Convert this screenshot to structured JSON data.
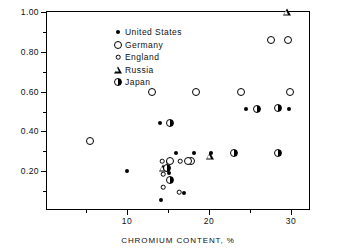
{
  "chart_data": {
    "type": "scatter",
    "title": "",
    "xlabel": "CHROMIUM  CONTENT, %",
    "ylabel": "CARBON  CONTENT, %",
    "xlim": [
      0.25,
      32.45
    ],
    "ylim": [
      0.0,
      1.0
    ],
    "grid": false,
    "legend_position": "top-left",
    "xticks_major": [
      10,
      20,
      30
    ],
    "xticks_major_labels": [
      "10",
      "20",
      "30"
    ],
    "xticks_minor": [
      5,
      15,
      25
    ],
    "yticks_major": [
      0.2,
      0.4,
      0.6,
      0.8,
      1.0
    ],
    "yticks_major_labels": [
      "0.20",
      "0.40",
      "0.60",
      "0.80",
      "1.00"
    ],
    "yticks_minor": [
      0.1,
      0.3,
      0.5,
      0.7,
      0.9
    ],
    "series": [
      {
        "name": "United States",
        "marker": "filled-dot",
        "points": [
          [
            10.0,
            0.2
          ],
          [
            14.0,
            0.44
          ],
          [
            15.0,
            0.245
          ],
          [
            15.1,
            0.19
          ],
          [
            15.1,
            0.155
          ],
          [
            16.0,
            0.29
          ],
          [
            18.2,
            0.29
          ],
          [
            20.3,
            0.29
          ],
          [
            24.5,
            0.515
          ],
          [
            29.8,
            0.515
          ],
          [
            14.1,
            0.055
          ],
          [
            16.9,
            0.09
          ]
        ]
      },
      {
        "name": "Germany",
        "marker": "open-circle-large",
        "points": [
          [
            5.5,
            0.35
          ],
          [
            13.0,
            0.6
          ],
          [
            18.4,
            0.6
          ],
          [
            23.9,
            0.6
          ],
          [
            29.9,
            0.6
          ],
          [
            27.6,
            0.86
          ],
          [
            29.6,
            0.86
          ],
          [
            15.3,
            0.25
          ],
          [
            17.8,
            0.25
          ],
          [
            17.5,
            0.25
          ]
        ]
      },
      {
        "name": "England",
        "marker": "open-circle-small",
        "points": [
          [
            14.3,
            0.25
          ],
          [
            16.5,
            0.25
          ],
          [
            14.4,
            0.185
          ],
          [
            14.4,
            0.12
          ],
          [
            16.4,
            0.095
          ]
        ]
      },
      {
        "name": "Russia",
        "marker": "open-triangle",
        "points": [
          [
            29.5,
            1.0
          ],
          [
            14.4,
            0.215
          ],
          [
            20.1,
            0.275
          ]
        ]
      },
      {
        "name": "Japan",
        "marker": "half-filled-circle",
        "points": [
          [
            15.2,
            0.44
          ],
          [
            14.9,
            0.215
          ],
          [
            15.2,
            0.155
          ],
          [
            23.0,
            0.29
          ],
          [
            28.4,
            0.29
          ],
          [
            28.4,
            0.52
          ],
          [
            25.9,
            0.515
          ]
        ]
      }
    ]
  },
  "legend": {
    "entries": [
      {
        "label": "United States",
        "marker": "filled-dot"
      },
      {
        "label": "Germany",
        "marker": "open-circle-large"
      },
      {
        "label": "England",
        "marker": "open-circle-small"
      },
      {
        "label": "Russia",
        "marker": "open-triangle"
      },
      {
        "label": "Japan",
        "marker": "half-filled-circle"
      }
    ]
  }
}
